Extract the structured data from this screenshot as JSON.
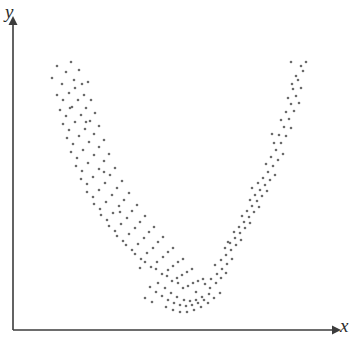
{
  "figure": {
    "background_color": "#ffffff",
    "width": 362,
    "height": 352
  },
  "axes": {
    "color": "#3c3c3c",
    "line_width": 1.6,
    "origin": {
      "x": 13,
      "y": 330
    },
    "x_axis": {
      "start_x": 13,
      "end_x": 332,
      "y": 330,
      "arrow": true
    },
    "y_axis": {
      "x": 13,
      "start_y": 330,
      "end_y": 25,
      "arrow": true
    },
    "x_label": "x",
    "y_label": "y"
  },
  "chart_data": {
    "type": "scatter",
    "title": "",
    "xlabel": "x",
    "ylabel": "y",
    "grid": false,
    "legend": null,
    "marker": {
      "shape": "circle",
      "color": "#6b6b6b",
      "size_px": 2.6
    },
    "xlim": [
      13,
      332
    ],
    "ylim": [
      330,
      25
    ],
    "axis_ticks": {
      "x": [],
      "y": []
    },
    "n_points": 192,
    "points": [
      [
        52,
        78
      ],
      [
        57,
        66
      ],
      [
        62,
        84
      ],
      [
        66,
        72
      ],
      [
        71,
        62
      ],
      [
        74,
        80
      ],
      [
        57,
        95
      ],
      [
        63,
        100
      ],
      [
        69,
        93
      ],
      [
        75,
        88
      ],
      [
        79,
        70
      ],
      [
        82,
        84
      ],
      [
        60,
        110
      ],
      [
        66,
        116
      ],
      [
        72,
        107
      ],
      [
        78,
        100
      ],
      [
        84,
        95
      ],
      [
        88,
        82
      ],
      [
        63,
        124
      ],
      [
        69,
        130
      ],
      [
        75,
        122
      ],
      [
        81,
        115
      ],
      [
        86,
        108
      ],
      [
        91,
        100
      ],
      [
        67,
        138
      ],
      [
        73,
        144
      ],
      [
        79,
        136
      ],
      [
        85,
        129
      ],
      [
        90,
        121
      ],
      [
        95,
        113
      ],
      [
        71,
        152
      ],
      [
        77,
        158
      ],
      [
        83,
        150
      ],
      [
        89,
        142
      ],
      [
        94,
        134
      ],
      [
        99,
        126
      ],
      [
        76,
        166
      ],
      [
        82,
        171
      ],
      [
        88,
        163
      ],
      [
        94,
        155
      ],
      [
        99,
        147
      ],
      [
        104,
        140
      ],
      [
        81,
        179
      ],
      [
        87,
        184
      ],
      [
        93,
        177
      ],
      [
        99,
        169
      ],
      [
        104,
        161
      ],
      [
        109,
        154
      ],
      [
        87,
        192
      ],
      [
        93,
        197
      ],
      [
        99,
        190
      ],
      [
        105,
        183
      ],
      [
        110,
        175
      ],
      [
        115,
        168
      ],
      [
        94,
        204
      ],
      [
        100,
        209
      ],
      [
        106,
        202
      ],
      [
        112,
        195
      ],
      [
        117,
        188
      ],
      [
        122,
        181
      ],
      [
        101,
        215
      ],
      [
        107,
        220
      ],
      [
        113,
        213
      ],
      [
        119,
        206
      ],
      [
        124,
        200
      ],
      [
        129,
        193
      ],
      [
        109,
        226
      ],
      [
        115,
        231
      ],
      [
        121,
        224
      ],
      [
        127,
        218
      ],
      [
        132,
        211
      ],
      [
        137,
        205
      ],
      [
        117,
        236
      ],
      [
        123,
        241
      ],
      [
        129,
        234
      ],
      [
        135,
        228
      ],
      [
        140,
        222
      ],
      [
        145,
        216
      ],
      [
        126,
        245
      ],
      [
        132,
        250
      ],
      [
        138,
        244
      ],
      [
        144,
        238
      ],
      [
        149,
        232
      ],
      [
        154,
        227
      ],
      [
        135,
        254
      ],
      [
        141,
        259
      ],
      [
        147,
        253
      ],
      [
        153,
        248
      ],
      [
        158,
        242
      ],
      [
        163,
        237
      ],
      [
        145,
        262
      ],
      [
        151,
        267
      ],
      [
        157,
        262
      ],
      [
        163,
        257
      ],
      [
        168,
        252
      ],
      [
        173,
        248
      ],
      [
        156,
        269
      ],
      [
        162,
        274
      ],
      [
        168,
        270
      ],
      [
        173,
        266
      ],
      [
        178,
        262
      ],
      [
        183,
        259
      ],
      [
        167,
        276
      ],
      [
        172,
        281
      ],
      [
        177,
        278
      ],
      [
        182,
        275
      ],
      [
        187,
        272
      ],
      [
        192,
        269
      ],
      [
        178,
        283
      ],
      [
        183,
        288
      ],
      [
        188,
        286
      ],
      [
        193,
        283
      ],
      [
        198,
        281
      ],
      [
        203,
        279
      ],
      [
        150,
        287
      ],
      [
        156,
        292
      ],
      [
        162,
        296
      ],
      [
        168,
        300
      ],
      [
        174,
        303
      ],
      [
        180,
        305
      ],
      [
        186,
        306
      ],
      [
        192,
        305
      ],
      [
        198,
        303
      ],
      [
        204,
        300
      ],
      [
        158,
        283
      ],
      [
        165,
        288
      ],
      [
        171,
        293
      ],
      [
        177,
        297
      ],
      [
        184,
        300
      ],
      [
        190,
        301
      ],
      [
        196,
        300
      ],
      [
        202,
        297
      ],
      [
        209,
        294
      ],
      [
        166,
        307
      ],
      [
        173,
        310
      ],
      [
        180,
        312
      ],
      [
        187,
        312
      ],
      [
        194,
        310
      ],
      [
        201,
        307
      ],
      [
        208,
        303
      ],
      [
        145,
        298
      ],
      [
        152,
        302
      ],
      [
        214,
        298
      ],
      [
        220,
        293
      ],
      [
        210,
        288
      ],
      [
        216,
        283
      ],
      [
        221,
        278
      ],
      [
        226,
        273
      ],
      [
        205,
        284
      ],
      [
        211,
        279
      ],
      [
        217,
        274
      ],
      [
        222,
        269
      ],
      [
        227,
        264
      ],
      [
        232,
        259
      ],
      [
        215,
        265
      ],
      [
        221,
        260
      ],
      [
        226,
        255
      ],
      [
        231,
        250
      ],
      [
        236,
        245
      ],
      [
        241,
        240
      ],
      [
        225,
        248
      ],
      [
        230,
        243
      ],
      [
        235,
        238
      ],
      [
        240,
        233
      ],
      [
        245,
        228
      ],
      [
        250,
        223
      ],
      [
        234,
        232
      ],
      [
        239,
        227
      ],
      [
        244,
        222
      ],
      [
        249,
        217
      ],
      [
        254,
        212
      ],
      [
        259,
        207
      ],
      [
        242,
        216
      ],
      [
        247,
        211
      ],
      [
        252,
        206
      ],
      [
        257,
        201
      ],
      [
        262,
        196
      ],
      [
        267,
        191
      ],
      [
        250,
        200
      ],
      [
        255,
        195
      ],
      [
        260,
        190
      ],
      [
        265,
        185
      ],
      [
        270,
        180
      ],
      [
        275,
        175
      ],
      [
        258,
        183
      ],
      [
        263,
        178
      ],
      [
        268,
        172
      ],
      [
        273,
        166
      ],
      [
        278,
        160
      ],
      [
        283,
        154
      ],
      [
        266,
        164
      ],
      [
        271,
        157
      ],
      [
        276,
        150
      ],
      [
        281,
        143
      ],
      [
        286,
        136
      ],
      [
        291,
        128
      ],
      [
        274,
        143
      ],
      [
        279,
        135
      ],
      [
        284,
        127
      ],
      [
        289,
        119
      ],
      [
        294,
        111
      ],
      [
        299,
        103
      ],
      [
        281,
        120
      ],
      [
        286,
        112
      ],
      [
        291,
        104
      ],
      [
        296,
        96
      ],
      [
        301,
        88
      ],
      [
        288,
        98
      ],
      [
        293,
        89
      ],
      [
        298,
        80
      ],
      [
        303,
        71
      ],
      [
        296,
        76
      ],
      [
        301,
        66
      ],
      [
        291,
        62
      ],
      [
        306,
        62
      ],
      [
        70,
        108
      ],
      [
        86,
        122
      ],
      [
        104,
        172
      ],
      [
        120,
        212
      ],
      [
        140,
        268
      ],
      [
        196,
        292
      ],
      [
        228,
        242
      ],
      [
        252,
        188
      ],
      [
        272,
        134
      ],
      [
        292,
        84
      ]
    ]
  }
}
